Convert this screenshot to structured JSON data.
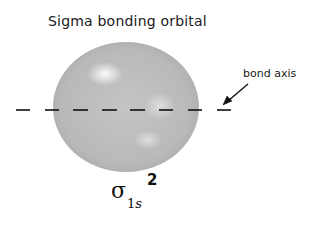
{
  "title": "Sigma bonding orbital",
  "annotation": {
    "label": "bond axis",
    "arrow_from": [
      248,
      84
    ],
    "arrow_to": [
      224,
      104
    ]
  },
  "orbital": {
    "shape": "sphere",
    "center": [
      126,
      107
    ],
    "rx": 73,
    "ry": 65,
    "fill": "#b8b8b8",
    "highlights": [
      {
        "cx": 105,
        "cy": 75
      },
      {
        "cx": 158,
        "cy": 108
      },
      {
        "cx": 148,
        "cy": 140
      }
    ]
  },
  "bond_axis": {
    "y": 110,
    "dashes": [
      [
        16,
        30
      ],
      [
        45,
        59
      ],
      [
        73,
        88
      ],
      [
        102,
        117
      ],
      [
        130,
        145
      ],
      [
        159,
        173
      ],
      [
        188,
        202
      ],
      [
        217,
        231
      ]
    ],
    "color": "#111111"
  },
  "notation": {
    "symbol": "σ",
    "subscript_number": "1",
    "subscript_letter": "s",
    "superscript": "2"
  }
}
